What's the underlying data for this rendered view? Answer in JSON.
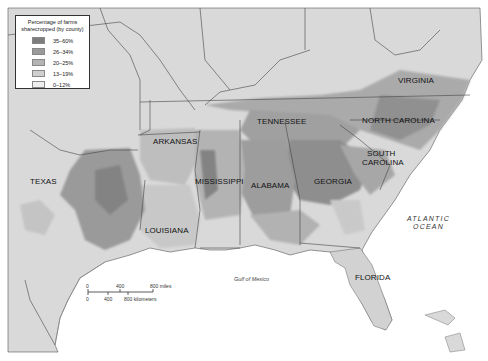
{
  "legend": {
    "title": "Percentage of farms sharecropped (by county)",
    "items": [
      {
        "label": "35–60%",
        "color": "#7d7d7d"
      },
      {
        "label": "26–34%",
        "color": "#9a9a9a"
      },
      {
        "label": "20–25%",
        "color": "#b4b4b4"
      },
      {
        "label": "13–19%",
        "color": "#cfcfcf"
      },
      {
        "label": "0–12%",
        "color": "#eeeeee"
      }
    ]
  },
  "states": {
    "virginia": "VIRGINIA",
    "north_carolina": "NORTH CAROLINA",
    "south_carolina_1": "SOUTH",
    "south_carolina_2": "CAROLINA",
    "tennessee": "TENNESSEE",
    "arkansas": "ARKANSAS",
    "mississippi": "MISSISSIPPI",
    "alabama": "ALABAMA",
    "georgia": "GEORGIA",
    "texas": "TEXAS",
    "louisiana": "LOUISIANA",
    "florida": "FLORIDA"
  },
  "water": {
    "atlantic_1": "ATLANTIC",
    "atlantic_2": "OCEAN",
    "gulf": "Gulf of Mexico"
  },
  "scale_bar": {
    "miles_ticks": [
      "0",
      "400",
      "800 miles"
    ],
    "km_ticks": [
      "0",
      "400",
      "800 kilometers"
    ]
  },
  "colors": {
    "land": "#d9d9d9",
    "water": "#ffffff",
    "border": "#444444"
  }
}
